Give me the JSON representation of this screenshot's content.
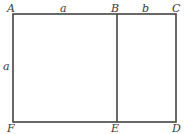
{
  "diagram": {
    "stroke_color": "#444444",
    "text_color": "#3a3a3a",
    "points": {
      "A": {
        "label": "A",
        "x": 13,
        "y": 14
      },
      "B": {
        "label": "B",
        "x": 117,
        "y": 14
      },
      "C": {
        "label": "C",
        "x": 176,
        "y": 14
      },
      "D": {
        "label": "D",
        "x": 176,
        "y": 122
      },
      "E": {
        "label": "E",
        "x": 117,
        "y": 122
      },
      "F": {
        "label": "F",
        "x": 13,
        "y": 122
      }
    },
    "segment_labels": {
      "top_ab": "a",
      "top_bc": "b",
      "left_af": "a"
    }
  }
}
